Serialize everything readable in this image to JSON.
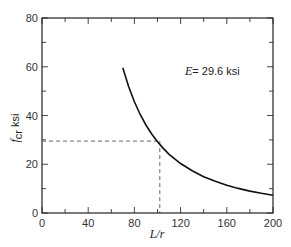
{
  "chart_data": {
    "type": "line",
    "title": "",
    "xlabel": "L/r",
    "ylabel_var": "f",
    "ylabel_sub": "cr",
    "ylabel_unit": "ksi",
    "xlim": [
      0,
      200
    ],
    "ylim": [
      0,
      80
    ],
    "x_major_ticks": [
      0,
      40,
      80,
      120,
      160,
      200
    ],
    "x_minor_ticks": [
      20,
      60,
      100,
      140,
      180
    ],
    "y_major_ticks": [
      0,
      20,
      40,
      60,
      80
    ],
    "y_minor_ticks": [
      10,
      30,
      50,
      70
    ],
    "x_tick_labels": [
      "0",
      "40",
      "80",
      "120",
      "160",
      "200"
    ],
    "y_tick_labels": [
      "0",
      "20",
      "40",
      "60",
      "80"
    ],
    "grid": false,
    "series": [
      {
        "name": "Euler buckling stress",
        "formula": "f_cr = pi^2 * E / (L/r)^2",
        "E_ksi": 29600,
        "x": [
          70,
          75,
          80,
          85,
          90,
          95,
          100,
          105,
          110,
          120,
          130,
          140,
          150,
          160,
          170,
          180,
          190,
          200
        ],
        "y": [
          59.6,
          51.9,
          45.6,
          40.4,
          36.1,
          32.4,
          29.2,
          26.5,
          24.1,
          20.3,
          17.3,
          14.9,
          13.0,
          11.4,
          10.1,
          9.0,
          8.1,
          7.3
        ]
      }
    ],
    "reference_point": {
      "x": 102,
      "y": 29.5,
      "style": "dashed"
    },
    "annotations": [
      {
        "var": "E",
        "text": "= 29.6 ksi",
        "position": "upper-right"
      }
    ]
  }
}
